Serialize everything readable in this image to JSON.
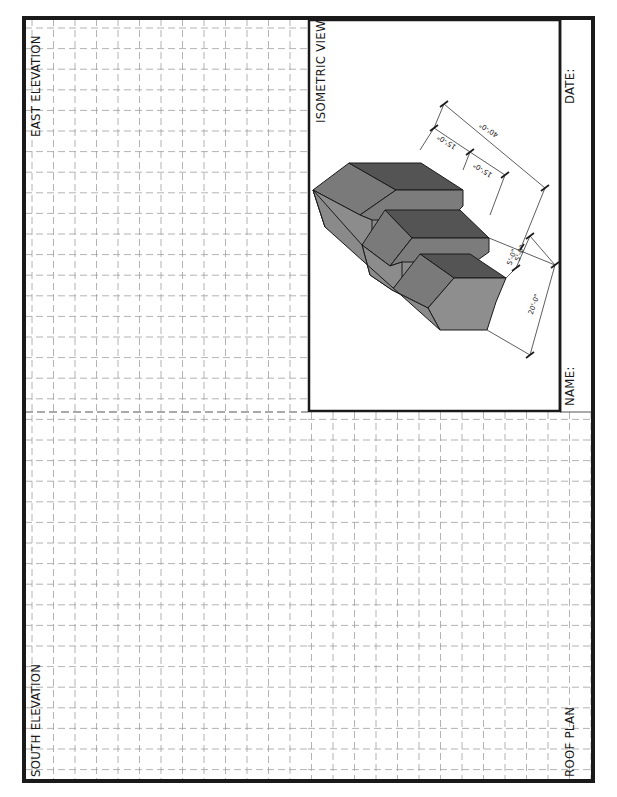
{
  "sheet": {
    "labels": {
      "east_elevation": "EAST ELEVATION",
      "south_elevation": "SOUTH ELEVATION",
      "roof_plan": "ROOF PLAN",
      "isometric_view": "ISOMETRIC VIEW",
      "name": "NAME:",
      "date": "DATE:"
    },
    "grid": {
      "style": "dashed",
      "cell_width_px": 21.5,
      "cell_height_px": 20.6,
      "color": "#9a9a9a"
    },
    "colors": {
      "border": "#1a1a1a",
      "face_dark": "#545454",
      "face_mid": "#787878",
      "face_light": "#8c8c8c",
      "dimension_line": "#333333"
    }
  },
  "isometric_drawing": {
    "dimensions": [
      {
        "label": "15'-0\"",
        "id": "upper-step-depth"
      },
      {
        "label": "40'-0\"",
        "id": "overall-length"
      },
      {
        "label": "15'-0\"",
        "id": "middle-step-depth"
      },
      {
        "label": "5'-0\"",
        "id": "step-rise-1"
      },
      {
        "label": "5'-0\"",
        "id": "step-rise-2"
      },
      {
        "label": "20'-0\"",
        "id": "overall-width"
      }
    ]
  }
}
